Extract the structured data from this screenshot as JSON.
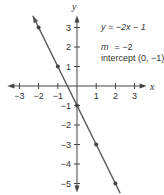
{
  "chart_data": {
    "type": "line",
    "title": "",
    "xlabel": "x",
    "ylabel": "y",
    "xlim": [
      -3,
      3
    ],
    "ylim": [
      -5,
      3
    ],
    "x_ticks": [
      -3,
      -2,
      -1,
      1,
      2,
      3
    ],
    "x_tick_labels": [
      "−3",
      "−2",
      "−1",
      "1",
      "2",
      "3"
    ],
    "y_ticks": [
      3,
      2,
      1,
      -1,
      -2,
      -3,
      -4,
      -5
    ],
    "y_tick_labels": [
      "3",
      "2",
      "1",
      "−1",
      "−2",
      "−3",
      "−4",
      "−5"
    ],
    "grid": false,
    "series": [
      {
        "name": "y = -2x - 1",
        "slope": -2,
        "intercept": -1,
        "x": [
          -2,
          -1,
          0,
          1,
          2
        ],
        "y": [
          3,
          1,
          -1,
          -3,
          -5
        ],
        "line_extent_x": [
          -2.3,
          2.25
        ],
        "color": "#555555"
      }
    ],
    "annotations": {
      "equation": "y = −2x − 1",
      "slope_label": "m",
      "slope_value": "= −2",
      "intercept_label": "intercept (0, −1)"
    }
  }
}
